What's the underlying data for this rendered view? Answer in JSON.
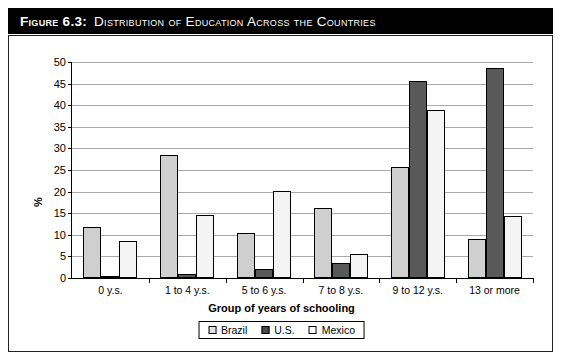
{
  "figure": {
    "number_label": "Figure 6.3:",
    "caption": "Distribution of Education Across the Countries"
  },
  "chart_data": {
    "type": "bar",
    "title": "Distribution of Education Across the Countries",
    "xlabel": "Group of years of schooling",
    "ylabel": "%",
    "ylim": [
      0,
      50
    ],
    "yticks": [
      0,
      5,
      10,
      15,
      20,
      25,
      30,
      35,
      40,
      45,
      50
    ],
    "ytick_labels": [
      "0",
      "5",
      "10",
      "15",
      "20",
      "25",
      "30",
      "35",
      "40",
      "45",
      "50"
    ],
    "grid": true,
    "legend_position": "bottom-center",
    "categories": [
      "0 y.s.",
      "1 to 4 y.s.",
      "5 to 6 y.s.",
      "7 to 8 y.s.",
      "9 to 12 y.s.",
      "13 or more"
    ],
    "series": [
      {
        "name": "Brazil",
        "color": "#cfcfcf",
        "values": [
          11.8,
          28.5,
          10.5,
          16.3,
          25.7,
          9.0
        ]
      },
      {
        "name": "U.S.",
        "color": "#595959",
        "values": [
          0.5,
          1.0,
          2.0,
          3.5,
          45.5,
          48.5
        ]
      },
      {
        "name": "Mexico",
        "color": "#f4f4f4",
        "values": [
          8.5,
          14.5,
          20.2,
          5.5,
          39.0,
          14.3
        ]
      }
    ]
  },
  "legend": {
    "items": [
      {
        "label": "Brazil"
      },
      {
        "label": "U.S."
      },
      {
        "label": "Mexico"
      }
    ]
  }
}
